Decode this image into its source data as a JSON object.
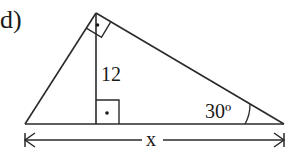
{
  "problem": {
    "label": "d)"
  },
  "diagram": {
    "type": "right-triangle-with-altitude",
    "stroke_color": "#2a2a2a",
    "text_color": "#1a1a1a",
    "altitude_label": "12",
    "angle_label": "30º",
    "base_label": "x",
    "right_angle_marks": [
      {
        "location": "apex",
        "symbol": "·"
      },
      {
        "location": "altitude-foot",
        "symbol": "·"
      }
    ]
  }
}
